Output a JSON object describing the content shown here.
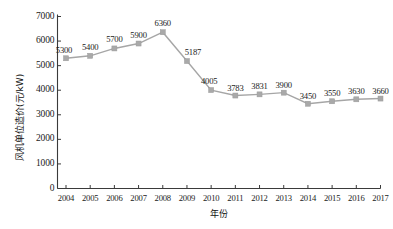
{
  "chart_data": {
    "type": "line",
    "title": "",
    "xlabel": "年份",
    "ylabel": "风机单位造价(元/kW)",
    "categories": [
      "2004",
      "2005",
      "2006",
      "2007",
      "2008",
      "2009",
      "2010",
      "2011",
      "2012",
      "2013",
      "2014",
      "2015",
      "2016",
      "2017"
    ],
    "values": [
      5300,
      5400,
      5700,
      5900,
      6360,
      5187,
      4005,
      3783,
      3831,
      3900,
      3450,
      3550,
      3630,
      3660
    ],
    "point_labels": [
      "5300",
      "5400",
      "5700",
      "5900",
      "6360",
      "5187",
      "4005",
      "3783",
      "3831",
      "3900",
      "3450",
      "3550",
      "3630",
      "3660"
    ],
    "ylim": [
      0,
      7000
    ],
    "ytick_labels": [
      "0",
      "1000",
      "2000",
      "3000",
      "4000",
      "5000",
      "6000",
      "7000"
    ],
    "ytick_values": [
      0,
      1000,
      2000,
      3000,
      4000,
      5000,
      6000,
      7000
    ],
    "grid": false,
    "legend": "none",
    "series_color": "#a9a9a9",
    "marker": "square",
    "axis_color": "#3a3a3a"
  }
}
